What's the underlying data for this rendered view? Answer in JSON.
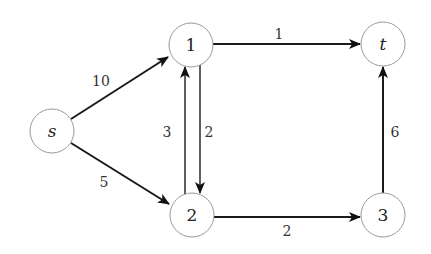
{
  "graph": {
    "type": "directed flow network",
    "nodes": [
      {
        "id": "s",
        "label": "s",
        "italic": true,
        "x": 52,
        "y": 131
      },
      {
        "id": "1",
        "label": "1",
        "italic": false,
        "x": 191,
        "y": 45
      },
      {
        "id": "2",
        "label": "2",
        "italic": false,
        "x": 192,
        "y": 215
      },
      {
        "id": "3",
        "label": "3",
        "italic": false,
        "x": 383,
        "y": 215
      },
      {
        "id": "t",
        "label": "t",
        "italic": true,
        "x": 383,
        "y": 44
      }
    ],
    "edges": [
      {
        "from": "s",
        "to": "1",
        "capacity": "10",
        "label_x": 101,
        "label_y": 81
      },
      {
        "from": "s",
        "to": "2",
        "capacity": "5",
        "label_x": 104,
        "label_y": 182
      },
      {
        "from": "2",
        "to": "1",
        "capacity": "3",
        "label_x": 167,
        "label_y": 132
      },
      {
        "from": "1",
        "to": "2",
        "capacity": "2",
        "label_x": 209,
        "label_y": 132
      },
      {
        "from": "1",
        "to": "t",
        "capacity": "1",
        "label_x": 279,
        "label_y": 34
      },
      {
        "from": "2",
        "to": "3",
        "capacity": "2",
        "label_x": 287,
        "label_y": 231
      },
      {
        "from": "3",
        "to": "t",
        "capacity": "6",
        "label_x": 395,
        "label_y": 132
      }
    ]
  }
}
